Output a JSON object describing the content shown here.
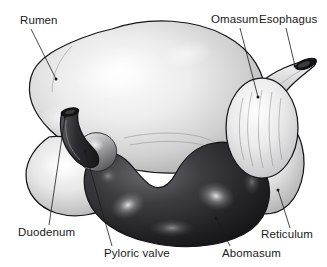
{
  "figure": {
    "style": "grayscale shaded anatomical illustration",
    "background_color": "#ffffff",
    "outline_color": "#16161a",
    "label_color": "#1a1a1a",
    "width": 327,
    "height": 267
  },
  "labels": [
    {
      "id": "rumen",
      "text": "Rumen",
      "text_x": 20,
      "text_y": 24,
      "anchor": "start",
      "leader": "M 31 29 L 56 79",
      "dot_x": 56,
      "dot_y": 79
    },
    {
      "id": "omasum",
      "text": "Omasum",
      "text_x": 211,
      "text_y": 23,
      "anchor": "start",
      "leader": "M 240 28 L 258 97",
      "dot_x": 258,
      "dot_y": 97
    },
    {
      "id": "esophagus",
      "text": "Esophagus",
      "text_x": 259,
      "text_y": 23,
      "anchor": "start",
      "leader": "M 286 28 L 295 66",
      "dot_x": 295,
      "dot_y": 66
    },
    {
      "id": "duodenum",
      "text": "Duodenum",
      "text_x": 18,
      "text_y": 236,
      "anchor": "start",
      "leader": "M 49 225 L 65 117",
      "dot_x": 65,
      "dot_y": 117
    },
    {
      "id": "pyloric-valve",
      "text": "Pyloric valve",
      "text_x": 104,
      "text_y": 257,
      "anchor": "start",
      "leader": "M 112 246 L 85 151",
      "dot_x": 85,
      "dot_y": 151
    },
    {
      "id": "abomasum",
      "text": "Abomasum",
      "text_x": 222,
      "text_y": 257,
      "anchor": "start",
      "leader": "M 230 246 L 216 218",
      "dot_x": 216,
      "dot_y": 218
    },
    {
      "id": "reticulum",
      "text": "Reticulum",
      "text_x": 261,
      "text_y": 238,
      "anchor": "start",
      "leader": "M 290 228 L 278 190",
      "dot_x": 278,
      "dot_y": 190
    }
  ],
  "organs": [
    {
      "id": "rumen",
      "name": "Rumen",
      "tone": "light gray",
      "description": "large dorsal sac occupying the upper left and center of the figure"
    },
    {
      "id": "ventral-rumen-sac",
      "name": "Ventral rumen sac",
      "tone": "light gray",
      "description": "rounded lobe at the lower left below the main rumen body"
    },
    {
      "id": "abomasum",
      "name": "Abomasum",
      "tone": "dark gray to black",
      "description": "dark curved sac forming the lower central portion with bright highlights"
    },
    {
      "id": "omasum",
      "name": "Omasum",
      "tone": "pale gray with internal leaves",
      "description": "oval organ at the right with longitudinal leaf striations"
    },
    {
      "id": "reticulum",
      "name": "Reticulum",
      "tone": "light gray",
      "description": "light lobe at the lower right behind the omasum"
    },
    {
      "id": "esophagus",
      "name": "Esophagus",
      "tone": "medium gray with dark lumen",
      "description": "tapered tube at the upper right ending in a dark cut opening"
    },
    {
      "id": "duodenum",
      "name": "Duodenum",
      "tone": "dark gray",
      "description": "dark curved tube rising from the abomasum with a dark cut opening at its tip"
    },
    {
      "id": "pyloric-valve",
      "name": "Pyloric valve",
      "tone": "mid gray bulge",
      "description": "rounded junction between the abomasum and the duodenum"
    }
  ]
}
